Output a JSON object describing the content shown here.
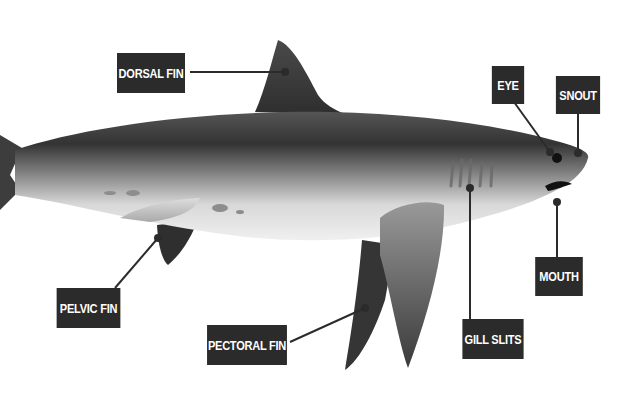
{
  "diagram": {
    "colors": {
      "label_bg": "#2b2b2b",
      "label_text": "#ffffff",
      "leader_line": "#2b2b2b",
      "body_dark": "#3a3a3a",
      "body_light": "#f2f2f2"
    },
    "labels": [
      {
        "id": "dorsal-fin",
        "text": "DORSAL FIN"
      },
      {
        "id": "eye",
        "text": "EYE"
      },
      {
        "id": "snout",
        "text": "SNOUT"
      },
      {
        "id": "mouth",
        "text": "MOUTH"
      },
      {
        "id": "gill-slits",
        "text": "GILL SLITS"
      },
      {
        "id": "pectoral-fin",
        "text": "PECTORAL FIN"
      },
      {
        "id": "pelvic-fin",
        "text": "PELVIC FIN"
      }
    ]
  }
}
